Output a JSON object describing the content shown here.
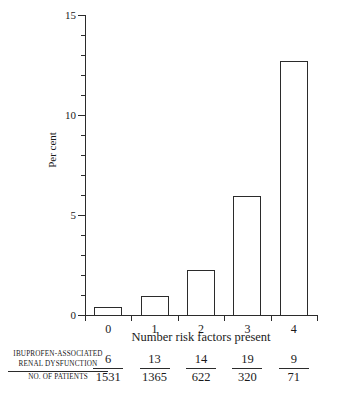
{
  "chart_data": {
    "type": "bar",
    "title": "",
    "subtitle": "",
    "xlabel": "Number risk factors present",
    "ylabel": "Per cent",
    "categories": [
      "0",
      "1",
      "2",
      "3",
      "4"
    ],
    "values": [
      0.39,
      0.95,
      2.25,
      5.94,
      12.68
    ],
    "ylim": [
      0,
      15
    ],
    "xlim": [
      0,
      5
    ],
    "y_major_ticks": [
      0,
      5,
      10,
      15
    ],
    "y_major_tick_labels": [
      "0",
      "5",
      "10",
      "15"
    ],
    "y_minor_tick_interval": 1,
    "grid": false,
    "legend": null,
    "bar_style": "unfilled-outline",
    "series": [
      {
        "name": "Ibuprofen-associated renal dysfunction rate",
        "values": [
          0.39,
          0.95,
          2.25,
          5.94,
          12.68
        ]
      }
    ],
    "annotations": {
      "table_row_labels": [
        "IBUPROFEN-ASSOCIATED",
        "RENAL DYSFUNCTION",
        "NO. OF PATIENTS"
      ],
      "numerators": [
        "6",
        "13",
        "14",
        "19",
        "9"
      ],
      "denominators": [
        "1531",
        "1365",
        "622",
        "320",
        "71"
      ]
    }
  },
  "axes": {
    "y_title": "Per cent",
    "x_title": "Number risk factors present",
    "y_ticks": [
      {
        "value": 15,
        "label": "15",
        "major": true
      },
      {
        "value": 14,
        "label": "",
        "major": false
      },
      {
        "value": 13,
        "label": "",
        "major": false
      },
      {
        "value": 12,
        "label": "",
        "major": false
      },
      {
        "value": 11,
        "label": "",
        "major": false
      },
      {
        "value": 10,
        "label": "10",
        "major": true
      },
      {
        "value": 9,
        "label": "",
        "major": false
      },
      {
        "value": 8,
        "label": "",
        "major": false
      },
      {
        "value": 7,
        "label": "",
        "major": false
      },
      {
        "value": 6,
        "label": "",
        "major": false
      },
      {
        "value": 5,
        "label": "5",
        "major": true
      },
      {
        "value": 4,
        "label": "",
        "major": false
      },
      {
        "value": 3,
        "label": "",
        "major": false
      },
      {
        "value": 2,
        "label": "",
        "major": false
      },
      {
        "value": 1,
        "label": "",
        "major": false
      },
      {
        "value": 0,
        "label": "0",
        "major": true
      }
    ],
    "x_tick_labels": [
      "0",
      "1",
      "2",
      "3",
      "4"
    ]
  },
  "table": {
    "row_label_line1": "IBUPROFEN-ASSOCIATED",
    "row_label_line2": "RENAL DYSFUNCTION",
    "row_label_line3": "NO. OF PATIENTS",
    "columns": [
      {
        "numerator": "6",
        "denominator": "1531"
      },
      {
        "numerator": "13",
        "denominator": "1365"
      },
      {
        "numerator": "14",
        "denominator": "622"
      },
      {
        "numerator": "19",
        "denominator": "320"
      },
      {
        "numerator": "9",
        "denominator": "71"
      }
    ]
  },
  "colors": {
    "ink": "#2b2b2b",
    "background": "#ffffff"
  }
}
